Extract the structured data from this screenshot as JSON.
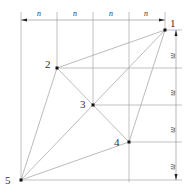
{
  "diagram": {
    "points": [
      {
        "label": "1",
        "x": 165,
        "y": 30
      },
      {
        "label": "2",
        "x": 57,
        "y": 68
      },
      {
        "label": "3",
        "x": 93,
        "y": 105
      },
      {
        "label": "4",
        "x": 129,
        "y": 142
      },
      {
        "label": "5",
        "x": 21,
        "y": 180
      }
    ],
    "top_dimension_labels": [
      "n",
      "n",
      "n",
      "n"
    ],
    "right_dimension_labels": [
      "m",
      "m",
      "m",
      "m"
    ],
    "colors": {
      "grid": "#999999",
      "edges": "#aaaaaa",
      "points": "#111111",
      "text": "#333333"
    }
  }
}
